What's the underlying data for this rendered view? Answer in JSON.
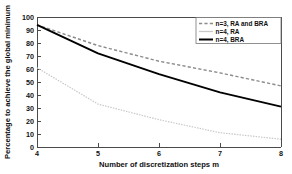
{
  "chart_data": {
    "type": "line",
    "title": "",
    "xlabel": "Number of discretization steps m",
    "ylabel": "Percentage to achieve the global minimum",
    "x": [
      4,
      5,
      6,
      7,
      8
    ],
    "xlim": [
      4,
      8
    ],
    "ylim": [
      0,
      100
    ],
    "xticks": [
      "4",
      "5",
      "6",
      "7",
      "8"
    ],
    "yticks": [
      "0",
      "10",
      "20",
      "30",
      "40",
      "50",
      "60",
      "70",
      "80",
      "90",
      "100"
    ],
    "grid": false,
    "legend_position": "top-right",
    "series": [
      {
        "name": "n=3, RA and BRA",
        "values": [
          94,
          78,
          66,
          57,
          47
        ],
        "style": "dashed",
        "color": "#8c8c8c",
        "width": 1.4
      },
      {
        "name": "n=4, RA",
        "values": [
          61,
          33,
          21,
          11,
          6
        ],
        "style": "dotted",
        "color": "#c8c8c8",
        "width": 1.2
      },
      {
        "name": "n=4, BRA",
        "values": [
          94,
          72,
          56,
          42,
          31
        ],
        "style": "solid",
        "color": "#000000",
        "width": 1.9
      }
    ]
  },
  "axes": {
    "y_title": "Percentage to achieve the global minimum",
    "x_title": "Number of discretization steps m"
  },
  "legend": {
    "entries": [
      {
        "label": "n=3, RA and BRA",
        "swatch": "dashed-gray-swatch"
      },
      {
        "label": "n=4, RA",
        "swatch": "solid-lightgray-swatch"
      },
      {
        "label": "n=4, BRA",
        "swatch": "solid-black-swatch"
      }
    ]
  }
}
